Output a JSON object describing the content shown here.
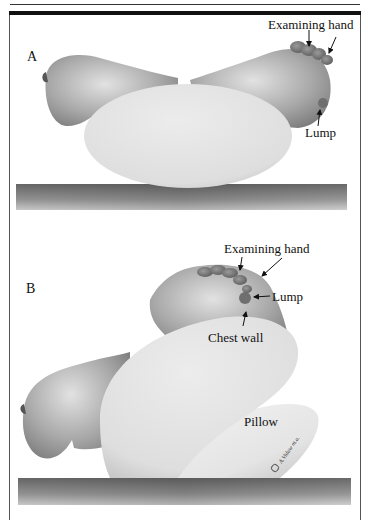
{
  "figure": {
    "panels": [
      {
        "id": "A",
        "letter": "A",
        "labels": {
          "examining_hand": "Examining hand",
          "lump": "Lump"
        }
      },
      {
        "id": "B",
        "letter": "B",
        "labels": {
          "examining_hand": "Examining hand",
          "lump": "Lump",
          "chest_wall": "Chest wall",
          "pillow": "Pillow"
        }
      }
    ],
    "signature": "© A.Vidaw m.a.",
    "colors": {
      "skin_dark": "#8a8a8a",
      "skin_light": "#d8d8d8",
      "body": "#e6e6e6",
      "table": "#7d7d7d",
      "hand": "#6e6e6e",
      "lump": "#7a7a7a",
      "frame": "#111111"
    }
  }
}
